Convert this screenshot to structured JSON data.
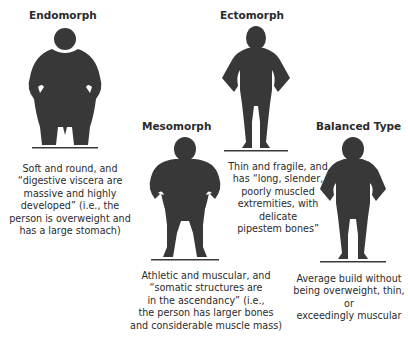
{
  "body_types": [
    {
      "name": "Endomorph",
      "description_lines": [
        "Soft and round, and",
        "“digestive viscera are",
        "massive and highly",
        "developed” (i.e., the",
        "person is overweight and",
        "has a large stomach)"
      ]
    },
    {
      "name": "Mesomorph",
      "description_lines": [
        "Athletic and muscular, and",
        "“somatic structures are",
        "in the ascendancy” (i.e.,",
        "the person has larger bones",
        "and considerable muscle mass)"
      ]
    },
    {
      "name": "Ectomorph",
      "description_lines": [
        "Thin and fragile, and",
        "has “long, slender,",
        "poorly muscled",
        "extremities, with delicate",
        "pipestem bones”"
      ]
    },
    {
      "name": "Balanced Type",
      "description_lines": [
        "Average build without",
        "being overweight, thin, or",
        "exceedingly muscular"
      ]
    }
  ],
  "colors": {
    "silhouette": "#383838",
    "text": "#2b2b2b",
    "ground": "#3a3a3a"
  }
}
